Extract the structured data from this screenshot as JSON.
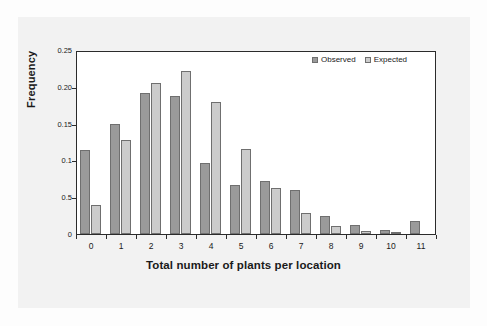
{
  "chart_data": {
    "type": "bar",
    "title": "",
    "subtitle": "",
    "xlabel": "Total number of plants per location",
    "ylabel": "Frequency",
    "categories": [
      "0",
      "1",
      "2",
      "3",
      "4",
      "5",
      "6",
      "7",
      "8",
      "9",
      "10",
      "11"
    ],
    "series": [
      {
        "name": "Observed",
        "color": "#9a9a9a",
        "values": [
          0.114,
          0.15,
          0.192,
          0.187,
          0.096,
          0.066,
          0.072,
          0.06,
          0.024,
          0.012,
          0.006,
          0.018
        ]
      },
      {
        "name": "Expected",
        "color": "#cccccc",
        "values": [
          0.04,
          0.128,
          0.205,
          0.222,
          0.179,
          0.115,
          0.062,
          0.029,
          0.011,
          0.004,
          0.002,
          0.0
        ]
      }
    ],
    "ylim": [
      0,
      0.25
    ],
    "ytick_values": [
      0.25,
      0.2,
      0.15,
      0.1,
      0.05,
      0.0
    ],
    "ytick_labels": [
      "0.25",
      "0.20",
      "0.15",
      "0.1",
      "0.5",
      "0"
    ],
    "grid": false,
    "legend_position": "top-right",
    "legend": [
      "Observed",
      "Expected"
    ]
  },
  "colors": {
    "observed": "#9a9a9a",
    "expected": "#cccccc",
    "bar_border": "#6f6f6f",
    "axis": "#2b2b2b",
    "panel_background": "#f2f2f2",
    "plot_background": "#ffffff",
    "text": "#1a1a1a"
  }
}
